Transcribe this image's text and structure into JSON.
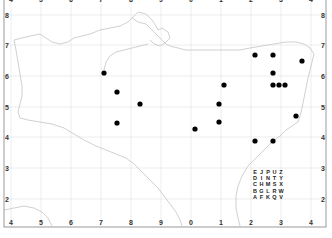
{
  "map": {
    "colors": {
      "frame": "#999999",
      "grid": "#dddddd",
      "coast": "#c8c8c8",
      "dot": "#000000",
      "background": "#ffffff"
    },
    "x_tick_labels": [
      "4",
      "5",
      "6",
      "7",
      "8",
      "9",
      "0",
      "1",
      "2",
      "3",
      "4"
    ],
    "y_tick_labels": [
      "8",
      "7",
      "6",
      "5",
      "4",
      "3",
      "2"
    ],
    "corner_label": "4",
    "legend_letter_grid": [
      [
        "E",
        "J",
        "P",
        "U",
        "Z"
      ],
      [
        "D",
        "I",
        "N",
        "T",
        "Y"
      ],
      [
        "C",
        "H",
        "M",
        "S",
        "X"
      ],
      [
        "B",
        "G",
        "L",
        "R",
        "W"
      ],
      [
        "A",
        "F",
        "K",
        "Q",
        "V"
      ]
    ],
    "dots": [
      {
        "x": 104,
        "y": 73
      },
      {
        "x": 117,
        "y": 92
      },
      {
        "x": 140,
        "y": 104
      },
      {
        "x": 117,
        "y": 123
      },
      {
        "x": 195,
        "y": 129
      },
      {
        "x": 219,
        "y": 104
      },
      {
        "x": 219,
        "y": 122
      },
      {
        "x": 224,
        "y": 85
      },
      {
        "x": 255,
        "y": 55
      },
      {
        "x": 273,
        "y": 55
      },
      {
        "x": 302,
        "y": 61
      },
      {
        "x": 273,
        "y": 73
      },
      {
        "x": 273,
        "y": 85
      },
      {
        "x": 279,
        "y": 85
      },
      {
        "x": 285,
        "y": 85
      },
      {
        "x": 296,
        "y": 116
      },
      {
        "x": 255,
        "y": 141
      },
      {
        "x": 273,
        "y": 141
      }
    ]
  }
}
